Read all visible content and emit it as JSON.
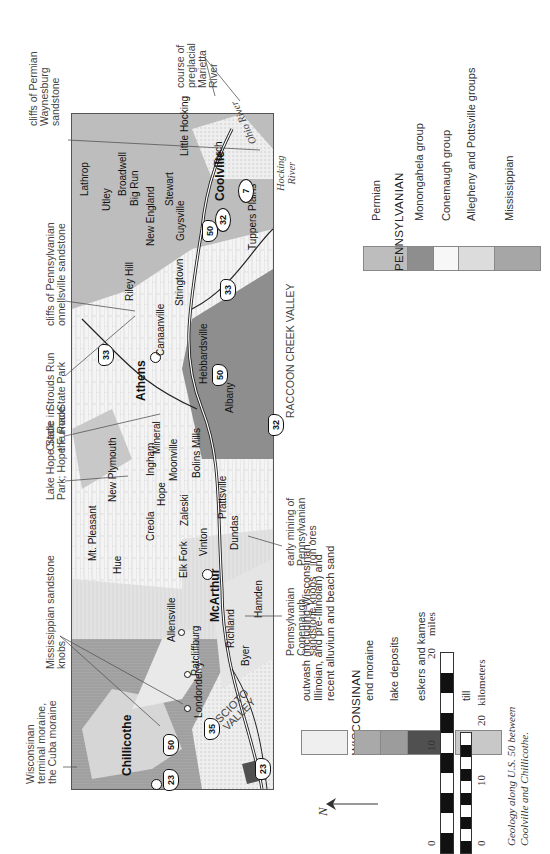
{
  "map": {
    "title_caption": [
      "Geology along U.S. 50 between",
      "Coolville and Chillicothe."
    ],
    "towns": [
      {
        "name": "Chillicothe",
        "bold": true
      },
      {
        "name": "Londonderry"
      },
      {
        "name": "Ratcliffburg"
      },
      {
        "name": "Allensville"
      },
      {
        "name": "Richland"
      },
      {
        "name": "Byer"
      },
      {
        "name": "McArthur",
        "bold": true
      },
      {
        "name": "Hamden"
      },
      {
        "name": "Elk Fork"
      },
      {
        "name": "Hue"
      },
      {
        "name": "Mt. Pleasant"
      },
      {
        "name": "Creola"
      },
      {
        "name": "Vinton"
      },
      {
        "name": "Dundas"
      },
      {
        "name": "Zaleski"
      },
      {
        "name": "Prattsville"
      },
      {
        "name": "Hope"
      },
      {
        "name": "New Plymouth"
      },
      {
        "name": "Moonville"
      },
      {
        "name": "Ingham"
      },
      {
        "name": "Bolins Mills"
      },
      {
        "name": "Mineral"
      },
      {
        "name": "Albany"
      },
      {
        "name": "Athens",
        "bold": true
      },
      {
        "name": "Hebbardsville"
      },
      {
        "name": "Canaanville"
      },
      {
        "name": "Stringtown"
      },
      {
        "name": "Riley Hill"
      },
      {
        "name": "New England"
      },
      {
        "name": "Guysville"
      },
      {
        "name": "Stewart"
      },
      {
        "name": "Utley"
      },
      {
        "name": "Big Run"
      },
      {
        "name": "Broadwell"
      },
      {
        "name": "Lathrop"
      },
      {
        "name": "Coolville",
        "bold": true
      },
      {
        "name": "Tuppers Plains"
      },
      {
        "name": "Torch"
      },
      {
        "name": "Little Hocking"
      }
    ],
    "routes": [
      "23",
      "23",
      "50",
      "35",
      "50",
      "33",
      "33",
      "32",
      "50",
      "32",
      "7"
    ],
    "regions": [
      "SCIOTO VALLEY",
      "RACCOON CREEK VALLEY"
    ],
    "rivers": [
      "Ohio River",
      "Hocking River"
    ],
    "annotations": [
      "Wisconsinan terminal moraine, the Cuba moraine",
      "Mississippian sandstone knobs",
      "Pennsylvanian Conemaugh sandstone knobs",
      "early mining of Pennsylvanian iron ores",
      "Lake Hope State Park; Hope Furnace",
      "Cradle in the Rock",
      "Strouds Run State Park",
      "cliffs of Pennsylvanian Connellsville sandstone",
      "cliffs of Permian Waynesburg sandstone",
      "course of preglacial Marietta River"
    ]
  },
  "annotations": {
    "cuba": [
      "Wisconsinan",
      "terminal moraine,",
      "the Cuba moraine"
    ],
    "miss_knobs": [
      "Mississippian sandstone",
      "knobs"
    ],
    "cone_knobs": [
      "Pennsylvanian",
      "Conemaugh",
      "sandstone knobs"
    ],
    "iron": [
      "early mining of",
      "Pennsylvanian",
      "iron ores"
    ],
    "lakehope": [
      "Lake Hope State",
      "Park; Hope Furnace"
    ],
    "cradle": [
      "Cradle in",
      "the Rock"
    ],
    "strouds": [
      "Strouds Run",
      "State Park"
    ],
    "connells": [
      "cliffs of Pennsylvanian",
      "onnellsville sandstone"
    ],
    "waynes": [
      "cliffs of Permian",
      "Waynesburg",
      "sandstone"
    ],
    "marietta": [
      "course of",
      "preglacial",
      "Marietta",
      "River"
    ],
    "raccoon": "RACCOON CREEK VALLEY",
    "scioto": [
      "SCIOTO",
      "VALLEY"
    ],
    "hocking": [
      "Hocking",
      "River"
    ],
    "ohio": "Ohio River"
  },
  "legend": {
    "outwash": [
      "outwash (including Wisconsinan,",
      "Illinoian, and pre-Illinoian) and",
      "recent alluvium and beach sand"
    ],
    "wisconsinan_header": "WISCONSINAN",
    "end_moraine": "end moraine",
    "lake_deposits": "lake deposits",
    "eskers": "eskers and kames",
    "illinoian_header": "ILLINOIAN",
    "till": "till",
    "permian": "Permian",
    "pennsylvanian_header": "PENNSYLVANIAN",
    "monongahela": "Monongahela group",
    "conemaugh": "Conemaugh group",
    "allegheny": "Allegheny and Pottsville groups",
    "mississippian": "Mississippian",
    "colors": {
      "outwash": "#efefef",
      "end_moraine": "#a9a9a9",
      "lake_deposits": "#9c9c9c",
      "eskers": "#505050",
      "till": "#c8c8c8",
      "permian": "#bdbdbd",
      "monongahela": "#8e8e8e",
      "conemaugh": "#f7f7f7",
      "allegheny": "#dcdcdc",
      "mississippian": "#a6a6a6"
    }
  },
  "scale": {
    "miles": {
      "ticks": [
        "0",
        "10",
        "20"
      ],
      "unit": "miles"
    },
    "km": {
      "ticks": [
        "0",
        "10",
        "20"
      ],
      "unit": "kilometers"
    },
    "north": "N"
  }
}
